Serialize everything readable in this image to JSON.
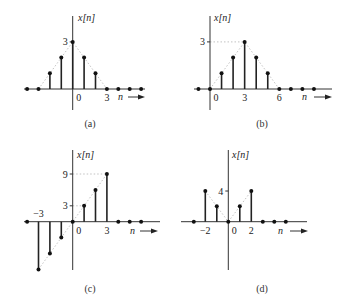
{
  "figure": {
    "panels": [
      {
        "id": "a",
        "caption": "(a)",
        "ylabel": "x[n]",
        "xlabel": "n",
        "x_tick_labels": [
          {
            "n": 0,
            "label": "0"
          },
          {
            "n": 3,
            "label": "3"
          }
        ],
        "y_tick_labels": [
          {
            "value": 3,
            "label": "3",
            "guide": false
          }
        ],
        "n": [
          -4,
          -3,
          -2,
          -1,
          0,
          1,
          2,
          3,
          4,
          5,
          6
        ],
        "values": [
          0,
          0,
          1,
          2,
          3,
          2,
          1,
          0,
          0,
          0,
          0
        ],
        "envelope": [
          [
            -3,
            0
          ],
          [
            0,
            3
          ],
          [
            3,
            0
          ]
        ]
      },
      {
        "id": "b",
        "caption": "(b)",
        "ylabel": "x[n]",
        "xlabel": "n",
        "x_tick_labels": [
          {
            "n": 0,
            "label": "0"
          },
          {
            "n": 3,
            "label": "3"
          },
          {
            "n": 6,
            "label": "6"
          }
        ],
        "y_tick_labels": [
          {
            "value": 3,
            "label": "3",
            "guide": true,
            "guide_to_n": 3
          }
        ],
        "n": [
          -1,
          0,
          1,
          2,
          3,
          4,
          5,
          6,
          7,
          8,
          9
        ],
        "values": [
          0,
          0,
          1,
          2,
          3,
          2,
          1,
          0,
          0,
          0,
          0
        ],
        "envelope": [
          [
            0,
            0
          ],
          [
            3,
            3
          ],
          [
            6,
            0
          ]
        ]
      },
      {
        "id": "c",
        "caption": "(c)",
        "ylabel": "x[n]",
        "xlabel": "n",
        "x_tick_labels": [
          {
            "n": -3,
            "label": "−3",
            "above": true
          },
          {
            "n": 0,
            "label": "0"
          },
          {
            "n": 3,
            "label": "3"
          }
        ],
        "y_tick_labels": [
          {
            "value": 9,
            "label": "9",
            "guide": true,
            "guide_to_n": 3
          },
          {
            "value": 3,
            "label": "3",
            "guide": true,
            "guide_to_n": 1
          }
        ],
        "n": [
          -4,
          -3,
          -2,
          -1,
          0,
          1,
          2,
          3,
          4,
          5,
          6
        ],
        "values": [
          0,
          -9,
          -6,
          -3,
          0,
          3,
          6,
          9,
          0,
          0,
          0
        ],
        "envelope": [
          [
            -3,
            -9
          ],
          [
            3,
            9
          ]
        ]
      },
      {
        "id": "d",
        "caption": "(d)",
        "ylabel": "x[n]",
        "xlabel": "n",
        "x_tick_labels": [
          {
            "n": -2,
            "label": "−2"
          },
          {
            "n": 0,
            "label": "0"
          },
          {
            "n": 2,
            "label": "2"
          }
        ],
        "y_tick_labels": [
          {
            "value": 4,
            "label": "4",
            "guide": false
          }
        ],
        "n": [
          -3,
          -2,
          -1,
          0,
          1,
          2,
          3,
          4,
          5
        ],
        "values": [
          0,
          4,
          2,
          0,
          2,
          4,
          0,
          0,
          0
        ],
        "envelope": [
          [
            -2,
            4
          ],
          [
            0,
            0
          ],
          [
            2,
            4
          ]
        ]
      }
    ]
  },
  "chart_data": [
    {
      "type": "stem",
      "title": "(a)",
      "xlabel": "n",
      "ylabel": "x[n]",
      "x": [
        -4,
        -3,
        -2,
        -1,
        0,
        1,
        2,
        3,
        4,
        5,
        6
      ],
      "values": [
        0,
        0,
        1,
        2,
        3,
        2,
        1,
        0,
        0,
        0,
        0
      ],
      "x_ticks": [
        "0",
        "3"
      ],
      "y_ticks": [
        "3"
      ],
      "grid": false
    },
    {
      "type": "stem",
      "title": "(b)",
      "xlabel": "n",
      "ylabel": "x[n]",
      "x": [
        -1,
        0,
        1,
        2,
        3,
        4,
        5,
        6,
        7,
        8,
        9
      ],
      "values": [
        0,
        0,
        1,
        2,
        3,
        2,
        1,
        0,
        0,
        0,
        0
      ],
      "x_ticks": [
        "0",
        "3",
        "6"
      ],
      "y_ticks": [
        "3"
      ],
      "grid": false
    },
    {
      "type": "stem",
      "title": "(c)",
      "xlabel": "n",
      "ylabel": "x[n]",
      "x": [
        -4,
        -3,
        -2,
        -1,
        0,
        1,
        2,
        3,
        4,
        5,
        6
      ],
      "values": [
        0,
        -9,
        -6,
        -3,
        0,
        3,
        6,
        9,
        0,
        0,
        0
      ],
      "x_ticks": [
        "−3",
        "0",
        "3"
      ],
      "y_ticks": [
        "3",
        "9"
      ],
      "grid": false
    },
    {
      "type": "stem",
      "title": "(d)",
      "xlabel": "n",
      "ylabel": "x[n]",
      "x": [
        -3,
        -2,
        -1,
        0,
        1,
        2,
        3,
        4,
        5
      ],
      "values": [
        0,
        4,
        2,
        0,
        2,
        4,
        0,
        0,
        0
      ],
      "x_ticks": [
        "−2",
        "0",
        "2"
      ],
      "y_ticks": [
        "4"
      ],
      "grid": false
    }
  ]
}
